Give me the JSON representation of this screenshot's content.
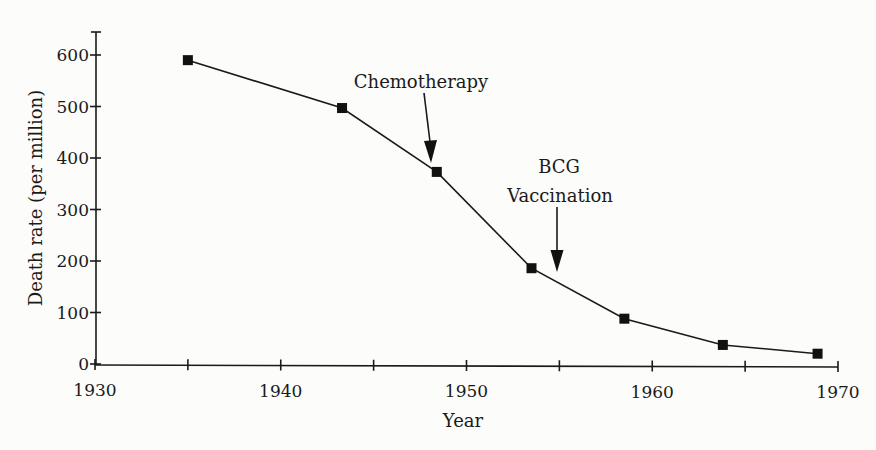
{
  "chart_data": {
    "type": "line",
    "title": "",
    "xlabel": "Year",
    "ylabel": "Death rate (per million)",
    "xlim": [
      1930,
      1970
    ],
    "ylim": [
      0,
      640
    ],
    "grid": false,
    "legend": null,
    "x_ticks": [
      1930,
      1935,
      1940,
      1945,
      1950,
      1955,
      1960,
      1965,
      1970
    ],
    "x_tick_labels": [
      "1930",
      "",
      "1940",
      "",
      "1950",
      "",
      "1960",
      "",
      "1970"
    ],
    "y_ticks": [
      0,
      100,
      200,
      300,
      400,
      500,
      600
    ],
    "y_tick_labels": [
      "0",
      "100",
      "200",
      "300",
      "400",
      "500",
      "600"
    ],
    "series": [
      {
        "name": "Tuberculosis death rate",
        "marker": "square",
        "x": [
          1935,
          1943.3,
          1948.4,
          1953.5,
          1958.5,
          1963.8,
          1968.9
        ],
        "values": [
          590,
          497,
          373,
          186,
          88,
          37,
          20
        ]
      }
    ],
    "annotations": [
      {
        "lines": [
          "Chemotherapy"
        ],
        "arrow_x": 1947.8,
        "arrow_from_value": 528,
        "arrow_to_value": 392,
        "arrow_from_year": 1947.5
      },
      {
        "lines": [
          "BCG",
          "Vaccination"
        ],
        "arrow_x": 1954.9,
        "arrow_from_value": 305,
        "arrow_to_value": 180,
        "arrow_from_year": 1954.9
      }
    ]
  }
}
